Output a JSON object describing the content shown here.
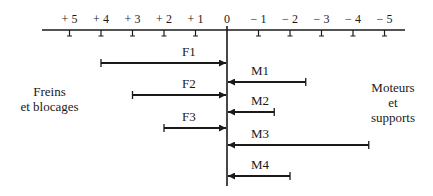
{
  "axis": {
    "ticks": [
      {
        "label": "+ 5",
        "value": 5
      },
      {
        "label": "+ 4",
        "value": 4
      },
      {
        "label": "+ 3",
        "value": 3
      },
      {
        "label": "+ 2",
        "value": 2
      },
      {
        "label": "+ 1",
        "value": 1
      },
      {
        "label": "0",
        "value": 0
      },
      {
        "label": "− 1",
        "value": -1
      },
      {
        "label": "− 2",
        "value": -2
      },
      {
        "label": "− 3",
        "value": -3
      },
      {
        "label": "− 4",
        "value": -4
      },
      {
        "label": "− 5",
        "value": -5
      }
    ]
  },
  "left_group": {
    "line1": "Freins",
    "line2": "et  blocages"
  },
  "right_group": {
    "line1": "Moteurs",
    "line2": "et",
    "line3": "supports"
  },
  "arrows": [
    {
      "label": "F1",
      "from": 4,
      "to": 0,
      "side": "left"
    },
    {
      "label": "M1",
      "from": -2.5,
      "to": 0,
      "side": "right"
    },
    {
      "label": "F2",
      "from": 3,
      "to": 0,
      "side": "left"
    },
    {
      "label": "M2",
      "from": -1.5,
      "to": 0,
      "side": "right"
    },
    {
      "label": "F3",
      "from": 2,
      "to": 0,
      "side": "left"
    },
    {
      "label": "M3",
      "from": -4.5,
      "to": 0,
      "side": "right"
    },
    {
      "label": "M4",
      "from": -2,
      "to": 0,
      "side": "right"
    }
  ],
  "colors": {
    "ink": "#1a1a1a",
    "background": "#ffffff"
  }
}
